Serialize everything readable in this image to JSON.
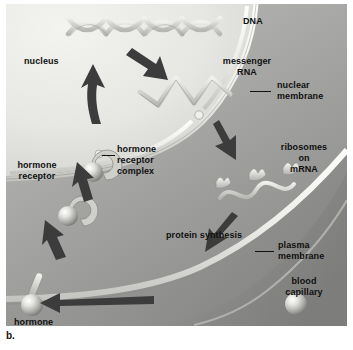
{
  "figure": {
    "caption": "b."
  },
  "palette": {
    "nucleus": "#e6e6e3",
    "cytoplasm": "#a9a9a7",
    "outside": "#9d9d9b",
    "capillary": "#919190",
    "membrane_light": "#f2f2ef",
    "arrow": "#3a3a3a",
    "text": "#101010",
    "sphere_hi": "#fbfbf8",
    "sphere_lo": "#8c8c8a"
  },
  "labels": {
    "nucleus": "nucleus",
    "dna": "DNA",
    "messenger_rna": "messenger\nRNA",
    "nuclear_membrane": "nuclear\nmembrane",
    "ribosomes_on_mrna": "ribosomes\non\nmRNA",
    "hormone_receptor": "hormone\nreceptor",
    "hormone_receptor_complex": "hormone\nreceptor\ncomplex",
    "protein_synthesis": "protein synthesis",
    "plasma_membrane": "plasma\nmembrane",
    "blood_capillary": "blood\ncapillary",
    "hormone": "hormone"
  },
  "structures": {
    "dna_helix": "DNA double helix, X-crossing strands across top of nucleus",
    "mrna_strand": "zigzag messenger RNA strand inside nucleus",
    "ribosome_count": 3,
    "nuclear_pore": "gap in the double nuclear membrane",
    "hormone_receptor_pairs": 2,
    "free_hormone_spheres": 2
  },
  "arrows": [
    {
      "name": "hormone-into-cell",
      "desc": "hormone crossing plasma membrane into cytoplasm"
    },
    {
      "name": "complex-to-nucleus",
      "desc": "hormone-receptor complex moving up toward nucleus"
    },
    {
      "name": "complex-through-pore",
      "desc": "complex entering nucleus through nuclear pore"
    },
    {
      "name": "dna-to-mrna",
      "desc": "DNA transcribed into messenger RNA"
    },
    {
      "name": "mrna-out-of-nucleus",
      "desc": "mRNA leaving nucleus into cytoplasm"
    },
    {
      "name": "ribosome-to-protein",
      "desc": "ribosomes on mRNA producing protein"
    },
    {
      "name": "hormone-from-capillary",
      "desc": "hormone released from blood capillary"
    }
  ]
}
